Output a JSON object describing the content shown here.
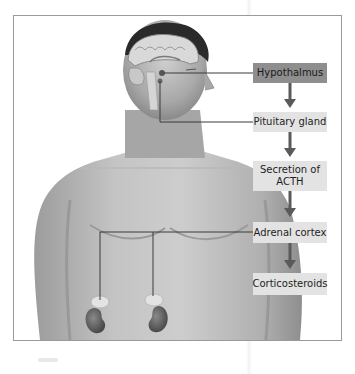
{
  "diagram": {
    "title": "",
    "flow_steps": [
      {
        "id": "hypothalmus",
        "label": "Hypothalmus",
        "highlighted": true
      },
      {
        "id": "pituitary",
        "label": "Pituitary gland",
        "highlighted": false
      },
      {
        "id": "acth",
        "label": "Secretion of ACTH",
        "highlighted": false
      },
      {
        "id": "adrenal",
        "label": "Adrenal cortex",
        "highlighted": false
      },
      {
        "id": "corticosteroids",
        "label": "Corticosteroids",
        "highlighted": false
      }
    ],
    "illustration": {
      "subject": "human torso with brain cross-section and kidneys",
      "callouts": [
        "hypothalamus",
        "pituitary gland",
        "adrenal glands"
      ]
    },
    "colors": {
      "primary_box": "#8e8e8e",
      "secondary_box": "#e3e3e3",
      "arrow": "#5a5a5a",
      "leader_line": "#3a3a3a",
      "frame": "#9a9a9a"
    }
  }
}
